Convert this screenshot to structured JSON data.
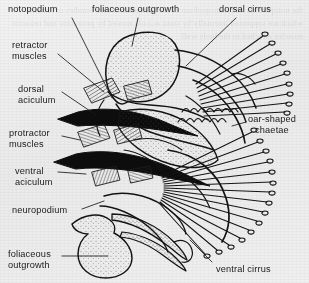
{
  "figure": {
    "background_color": "#efeeec",
    "ink_color": "#1a1a1a"
  },
  "ghost_text": "the notopodium and neuropodium of the parapodium bear bundles of chaetae which are supported internally by stout acicula moved by protractor and retractor muscles attached to the body wall",
  "labels": [
    {
      "id": "notopodium",
      "text": "notopodium",
      "x": 8,
      "y": 4,
      "align": "left"
    },
    {
      "id": "foliaceous-outgrowth-top",
      "text": "foliaceous outgrowth",
      "x": 92,
      "y": 4,
      "align": "left"
    },
    {
      "id": "dorsal-cirrus",
      "text": "dorsal cirrus",
      "x": 219,
      "y": 4,
      "align": "left"
    },
    {
      "id": "retractor-muscles",
      "text": "retractor\nmuscles",
      "x": 12,
      "y": 40,
      "align": "left"
    },
    {
      "id": "dorsal-aciculum",
      "text": "dorsal\naciculum",
      "x": 18,
      "y": 84,
      "align": "left"
    },
    {
      "id": "protractor-muscles",
      "text": "protractor\nmuscles",
      "x": 9,
      "y": 128,
      "align": "left"
    },
    {
      "id": "ventral-aciculum",
      "text": "ventral\naciculum",
      "x": 15,
      "y": 166,
      "align": "left"
    },
    {
      "id": "oar-shaped-chaetae",
      "text": "oar-shaped\nchaetae",
      "x": 248,
      "y": 114,
      "align": "center"
    },
    {
      "id": "neuropodium",
      "text": "neuropodium",
      "x": 12,
      "y": 205,
      "align": "left"
    },
    {
      "id": "foliaceous-outgrowth-bottom",
      "text": "foliaceous\noutgrowth",
      "x": 8,
      "y": 249,
      "align": "left"
    },
    {
      "id": "ventral-cirrus",
      "text": "ventral cirrus",
      "x": 216,
      "y": 264,
      "align": "left"
    }
  ],
  "structures": [
    {
      "id": "notopodium-lobe",
      "label": "notopodium"
    },
    {
      "id": "foliaceous-outgrowth-dorsal",
      "label": "foliaceous outgrowth"
    },
    {
      "id": "dorsal-cirrus-body",
      "label": "dorsal cirrus"
    },
    {
      "id": "dorsal-aciculum-bar",
      "label": "dorsal aciculum"
    },
    {
      "id": "ventral-aciculum-bar",
      "label": "ventral aciculum"
    },
    {
      "id": "retractor-muscle-band",
      "label": "retractor muscles"
    },
    {
      "id": "protractor-muscle-band",
      "label": "protractor muscles"
    },
    {
      "id": "notopodial-chaetal-fan",
      "label": "dorsal oar-shaped chaetae fan"
    },
    {
      "id": "neuropodial-chaetal-fan",
      "label": "ventral oar-shaped chaetae fan"
    },
    {
      "id": "neuropodium-lobe",
      "label": "neuropodium"
    },
    {
      "id": "foliaceous-outgrowth-ventral",
      "label": "foliaceous outgrowth"
    },
    {
      "id": "ventral-cirrus-body",
      "label": "ventral cirrus"
    }
  ]
}
